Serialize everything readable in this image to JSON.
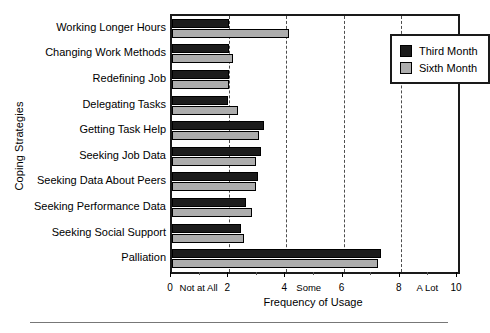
{
  "chart_data": {
    "type": "bar",
    "orientation": "horizontal",
    "title": "",
    "xlabel": "Frequency of Usage",
    "ylabel": "Coping Strategies",
    "xlim": [
      0,
      10
    ],
    "grid": true,
    "gridlines": [
      2,
      4,
      6,
      8
    ],
    "legend_position": "top-right",
    "categories": [
      "Working Longer Hours",
      "Changing Work Methods",
      "Redefining Job",
      "Delegating Tasks",
      "Getting Task Help",
      "Seeking Job Data",
      "Seeking Data About Peers",
      "Seeking Performance Data",
      "Seeking Social Support",
      "Palliation"
    ],
    "series": [
      {
        "name": "Third Month",
        "color": "#1c1c1c",
        "values": [
          2.0,
          2.0,
          2.0,
          1.95,
          3.2,
          3.1,
          3.0,
          2.6,
          2.4,
          7.3
        ]
      },
      {
        "name": "Sixth Month",
        "color": "#adadad",
        "values": [
          4.1,
          2.15,
          2.0,
          2.3,
          3.05,
          2.95,
          2.95,
          2.8,
          2.5,
          7.2
        ]
      }
    ],
    "xticks": [
      0,
      2,
      4,
      6,
      8,
      10
    ],
    "xtick_labels": [
      "0",
      "2",
      "4",
      "6",
      "8",
      "10"
    ],
    "xtick_words": [
      {
        "value": 1.0,
        "label": "Not at All"
      },
      {
        "value": 4.85,
        "label": "Some"
      },
      {
        "value": 9.0,
        "label": "A Lot"
      }
    ],
    "minor_ticks": [
      1,
      3,
      5,
      7,
      9
    ]
  },
  "legend": {
    "items": [
      {
        "label": "Third Month",
        "swatch": "third"
      },
      {
        "label": "Sixth Month",
        "swatch": "sixth"
      }
    ]
  }
}
